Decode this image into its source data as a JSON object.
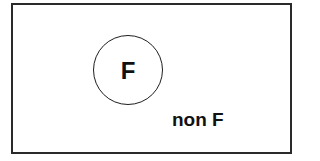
{
  "diagram": {
    "type": "venn",
    "universe": {
      "shape": "rectangle",
      "border_color": "#2a2a2a"
    },
    "set": {
      "label": "F",
      "shape": "circle",
      "border_color": "#1e1e1e"
    },
    "complement": {
      "label": "non F"
    }
  }
}
